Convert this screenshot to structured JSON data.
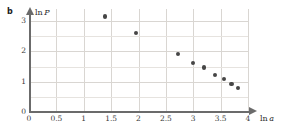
{
  "panel": {
    "label": "b"
  },
  "chart_data": {
    "type": "scatter",
    "title": "",
    "xlabel": "ln a",
    "ylabel": "ln P",
    "xlim": [
      0,
      4
    ],
    "ylim": [
      0,
      3.4
    ],
    "grid": true,
    "legend": null,
    "xticks": [
      0,
      0.5,
      1,
      1.5,
      2,
      2.5,
      3,
      3.5,
      4
    ],
    "xtick_labels": [
      "0",
      "0.5",
      "1",
      "1.5",
      "2",
      "2.5",
      "3",
      "3.5",
      "4"
    ],
    "yticks": [
      0,
      1,
      2,
      3
    ],
    "ytick_labels": [
      "0",
      "1",
      "2",
      "3"
    ],
    "marker_color": "#464646",
    "points": [
      {
        "x": 1.39,
        "y": 3.15
      },
      {
        "x": 1.95,
        "y": 2.62
      },
      {
        "x": 2.72,
        "y": 1.92
      },
      {
        "x": 3.0,
        "y": 1.62
      },
      {
        "x": 3.19,
        "y": 1.47
      },
      {
        "x": 3.4,
        "y": 1.22
      },
      {
        "x": 3.56,
        "y": 1.08
      },
      {
        "x": 3.7,
        "y": 0.93
      },
      {
        "x": 3.81,
        "y": 0.78
      }
    ]
  },
  "colors": {
    "grid": "#d9d6d2",
    "axis": "#6b6b6b",
    "marker": "#464646",
    "text": "#2b2b2b",
    "background": "#ffffff"
  }
}
